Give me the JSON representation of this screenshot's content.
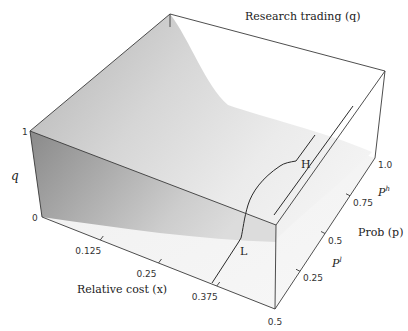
{
  "chart_data": {
    "type": "surface3d",
    "title": "Research trading (q)",
    "title_var": "q",
    "xlabel": "Relative cost (x)",
    "xlabel_var": "x",
    "ylabel": "Prob (p)",
    "ylabel_var": "p",
    "zlabel": "q",
    "x_ticks": [
      "0.125",
      "0.25",
      "0.375",
      "0.5"
    ],
    "x_tick_values": [
      0.125,
      0.25,
      0.375,
      0.5
    ],
    "xlim": [
      0,
      0.5
    ],
    "p_ticks": [
      "0.25",
      "0.5",
      "0.75",
      "1.0"
    ],
    "p_tick_values": [
      0.25,
      0.5,
      0.75,
      1.0
    ],
    "plim": [
      0,
      1.0
    ],
    "p_markers": [
      {
        "label": "P",
        "sup": "l",
        "value": 0.25
      },
      {
        "label": "P",
        "sup": "h",
        "value": 0.75
      }
    ],
    "z_ticks": [
      "0",
      "1"
    ],
    "z_tick_values": [
      0,
      1
    ],
    "zlim": [
      0,
      1
    ],
    "annotations": [
      {
        "text": "H",
        "description": "boundary curve end at high probability"
      },
      {
        "text": "L",
        "description": "boundary curve end at low probability"
      }
    ],
    "surface_description": "q decreases from 1 at x=0 toward 0 as relative cost x increases; steeper decline for high p",
    "grid": false,
    "legend": "none"
  }
}
